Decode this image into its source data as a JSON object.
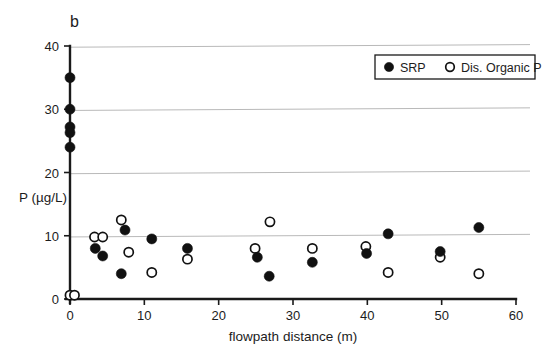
{
  "figure": {
    "panel_label": "b",
    "background_color": "#ffffff",
    "ink_color": "#111111",
    "grid_color": "#b9b9b9"
  },
  "legend": {
    "position": "top-right",
    "entries": [
      {
        "marker": "filled-circle",
        "label": "SRP"
      },
      {
        "marker": "open-circle",
        "label": "Dis. Organic P"
      }
    ]
  },
  "chart_data": {
    "type": "scatter",
    "title": "b",
    "xlabel": "flowpath distance (m)",
    "ylabel": "P (µg/L)",
    "xlim": [
      0,
      60
    ],
    "ylim": [
      0,
      40
    ],
    "xticks": [
      0,
      10,
      20,
      30,
      40,
      50,
      60
    ],
    "xtick_labels": [
      "0",
      "10",
      "20",
      "30",
      "40",
      "50",
      "60"
    ],
    "yticks": [
      0,
      10,
      20,
      30,
      40
    ],
    "ytick_labels": [
      "0",
      "10",
      "20",
      "30",
      "40"
    ],
    "grid": "horizontal",
    "gridlines_y": [
      10,
      20,
      30,
      40
    ],
    "legend_position": "top-right",
    "series": [
      {
        "name": "SRP",
        "marker": "filled-circle",
        "color": "#111111",
        "points": [
          [
            0,
            35.0
          ],
          [
            0,
            30.0
          ],
          [
            0,
            27.2
          ],
          [
            0,
            26.3
          ],
          [
            0,
            24.0
          ],
          [
            3.4,
            8.0
          ],
          [
            4.4,
            6.8
          ],
          [
            6.9,
            4.0
          ],
          [
            7.4,
            10.9
          ],
          [
            11.0,
            9.5
          ],
          [
            15.8,
            8.0
          ],
          [
            25.2,
            6.6
          ],
          [
            26.8,
            3.6
          ],
          [
            32.6,
            5.8
          ],
          [
            39.9,
            7.2
          ],
          [
            42.8,
            10.3
          ],
          [
            49.8,
            7.5
          ],
          [
            55.0,
            11.3
          ]
        ]
      },
      {
        "name": "Dis. Organic P",
        "marker": "open-circle",
        "color": "#ffffff",
        "points": [
          [
            0,
            0.6
          ],
          [
            0.6,
            0.6
          ],
          [
            3.3,
            9.8
          ],
          [
            4.4,
            9.8
          ],
          [
            6.9,
            12.5
          ],
          [
            7.9,
            7.4
          ],
          [
            11.0,
            4.2
          ],
          [
            15.8,
            6.3
          ],
          [
            24.9,
            8.0
          ],
          [
            26.9,
            12.2
          ],
          [
            32.6,
            8.0
          ],
          [
            39.8,
            8.3
          ],
          [
            42.8,
            4.2
          ],
          [
            49.8,
            6.6
          ],
          [
            55.0,
            4.0
          ]
        ]
      }
    ]
  }
}
